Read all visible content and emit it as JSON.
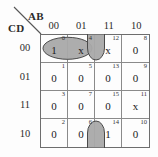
{
  "diagram": {
    "type": "karnaugh-map",
    "variables_top": "AB",
    "variables_side": "CD",
    "col_headers": [
      "00",
      "01",
      "11",
      "10"
    ],
    "row_headers": [
      "00",
      "01",
      "11",
      "10"
    ],
    "cells": [
      {
        "index": "0",
        "value": "1",
        "row": 0,
        "col": 0
      },
      {
        "index": "4",
        "value": "x",
        "row": 0,
        "col": 1
      },
      {
        "index": "12",
        "value": "x",
        "row": 0,
        "col": 2
      },
      {
        "index": "8",
        "value": "0",
        "row": 0,
        "col": 3
      },
      {
        "index": "1",
        "value": "0",
        "row": 1,
        "col": 0
      },
      {
        "index": "5",
        "value": "0",
        "row": 1,
        "col": 1
      },
      {
        "index": "13",
        "value": "0",
        "row": 1,
        "col": 2
      },
      {
        "index": "9",
        "value": "0",
        "row": 1,
        "col": 3
      },
      {
        "index": "3",
        "value": "0",
        "row": 2,
        "col": 0
      },
      {
        "index": "7",
        "value": "0",
        "row": 2,
        "col": 1
      },
      {
        "index": "15",
        "value": "0",
        "row": 2,
        "col": 2
      },
      {
        "index": "11",
        "value": "x",
        "row": 2,
        "col": 3
      },
      {
        "index": "2",
        "value": "0",
        "row": 3,
        "col": 0
      },
      {
        "index": "6",
        "value": "0",
        "row": 3,
        "col": 1
      },
      {
        "index": "14",
        "value": "1",
        "row": 3,
        "col": 2
      },
      {
        "index": "10",
        "value": "0",
        "row": 3,
        "col": 3
      }
    ],
    "groups": [
      {
        "name": "group-horizontal-0-4",
        "shape": "ellipse",
        "covers": [
          "0",
          "4"
        ]
      },
      {
        "name": "group-wrap-12-14",
        "shape": "split-ellipse",
        "covers": [
          "12",
          "14"
        ]
      }
    ],
    "colors": {
      "group_fill": "#a9a9a9",
      "group_stroke": "#4a4a4a",
      "grid_line": "#8a8a8a",
      "grid_border": "#6d6d6d",
      "text": "#1a1a1a",
      "background": "#fdfdfd"
    }
  }
}
